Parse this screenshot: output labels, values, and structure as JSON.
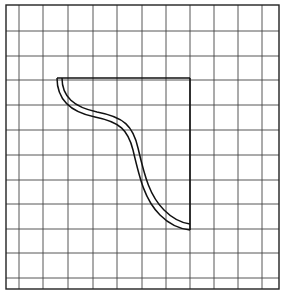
{
  "diagram": {
    "type": "grid-drawing",
    "grid": {
      "left": 6,
      "top": 5,
      "right": 279,
      "bottom": 289,
      "vertical_lines": [
        19,
        43,
        68,
        93,
        117,
        142,
        166,
        190,
        214,
        238,
        262
      ],
      "horizontal_lines": [
        31,
        56,
        80,
        105,
        130,
        155,
        180,
        204,
        229,
        253,
        278
      ],
      "line_color": "#444444",
      "border_color": "#222222"
    },
    "shape": {
      "stroke_color": "#111111",
      "top_edge": {
        "x1": 57,
        "y1": 78,
        "x2": 190,
        "y2": 78
      },
      "right_edge": {
        "x1": 190,
        "y1": 78,
        "x2": 190,
        "y2": 230
      },
      "outer_curve": "M57,78 C57,100 70,112 95,117 C120,122 128,130 133,150 C140,180 145,200 160,215 C170,225 180,229 190,230",
      "inner_curve": "M62,78 C62,97 74,107 97,112 C124,117 133,126 138,148 C145,178 150,196 164,210 C173,219 182,223 190,224"
    }
  }
}
